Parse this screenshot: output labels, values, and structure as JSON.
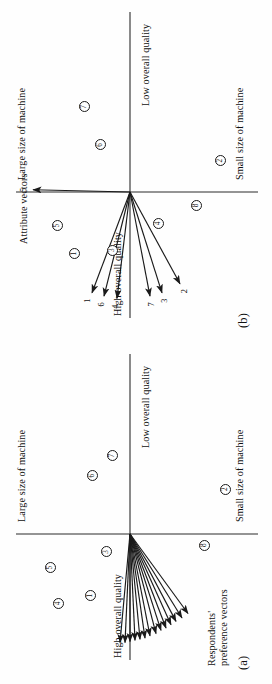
{
  "figure": {
    "orientation_note": "page-rotated-90-ccw",
    "panels": [
      {
        "key": "a",
        "label": "(a)",
        "axis_captions": {
          "top": "Large size of machine",
          "bottom": "Small size of machine",
          "left": "High overall quality",
          "right": "Low overall quality"
        },
        "group_caption_line1": "Respondents'",
        "group_caption_line2": "preference vectors",
        "vector_labels": [],
        "points": [
          {
            "label": "4",
            "x": -0.62,
            "y": 0.72
          },
          {
            "label": "5",
            "x": -0.3,
            "y": 0.8
          },
          {
            "label": "1",
            "x": -0.55,
            "y": 0.4
          },
          {
            "label": "3",
            "x": -0.16,
            "y": 0.24
          },
          {
            "label": "6",
            "x": 0.52,
            "y": 0.38
          },
          {
            "label": "7",
            "x": 0.7,
            "y": 0.18
          },
          {
            "label": "8",
            "x": -0.1,
            "y": -0.74
          },
          {
            "label": "2",
            "x": 0.4,
            "y": -0.95
          }
        ],
        "vectors": [
          {
            "label": "",
            "x": -0.97,
            "y": 0.1
          },
          {
            "label": "",
            "x": -0.97,
            "y": 0.05
          },
          {
            "label": "",
            "x": -0.96,
            "y": 0.0
          },
          {
            "label": "",
            "x": -0.95,
            "y": -0.05
          },
          {
            "label": "",
            "x": -0.94,
            "y": -0.1
          },
          {
            "label": "",
            "x": -0.93,
            "y": -0.15
          },
          {
            "label": "",
            "x": -0.91,
            "y": -0.2
          },
          {
            "label": "",
            "x": -0.89,
            "y": -0.26
          },
          {
            "label": "",
            "x": -0.86,
            "y": -0.31
          },
          {
            "label": "",
            "x": -0.84,
            "y": -0.36
          },
          {
            "label": "",
            "x": -0.81,
            "y": -0.41
          },
          {
            "label": "",
            "x": -0.78,
            "y": -0.46
          },
          {
            "label": "",
            "x": -0.75,
            "y": -0.52
          },
          {
            "label": "",
            "x": -0.71,
            "y": -0.58
          }
        ]
      },
      {
        "key": "b",
        "label": "(b)",
        "axis_captions": {
          "top": "Large size of machine",
          "bottom": "Small size of machine",
          "left": "High overall quality",
          "right": "Low overall quality"
        },
        "group_caption_line1": "Attribute vectors",
        "group_caption_line2": "",
        "points": [
          {
            "label": "5",
            "x": -0.3,
            "y": 0.73
          },
          {
            "label": "1",
            "x": -0.55,
            "y": 0.56
          },
          {
            "label": "3",
            "x": -0.52,
            "y": 0.18
          },
          {
            "label": "6",
            "x": 0.42,
            "y": 0.3
          },
          {
            "label": "7",
            "x": 0.76,
            "y": 0.46
          },
          {
            "label": "8",
            "x": -0.12,
            "y": -0.66
          },
          {
            "label": "2",
            "x": 0.28,
            "y": -0.9
          },
          {
            "label": "4",
            "x": -0.28,
            "y": -0.28
          }
        ],
        "vectors": [
          {
            "label": "5",
            "x": 0.02,
            "y": 0.97
          },
          {
            "label": "1",
            "x": -0.9,
            "y": 0.38
          },
          {
            "label": "6",
            "x": -0.93,
            "y": 0.26
          },
          {
            "label": "4",
            "x": -0.95,
            "y": 0.13
          },
          {
            "label": "7",
            "x": -0.93,
            "y": -0.2
          },
          {
            "label": "3",
            "x": -0.9,
            "y": -0.32
          },
          {
            "label": "2",
            "x": -0.82,
            "y": -0.5
          }
        ]
      }
    ]
  },
  "colors": {
    "ink": "#1a1a1a",
    "paper": "#ffffff",
    "axis": "#2a2a2a"
  }
}
